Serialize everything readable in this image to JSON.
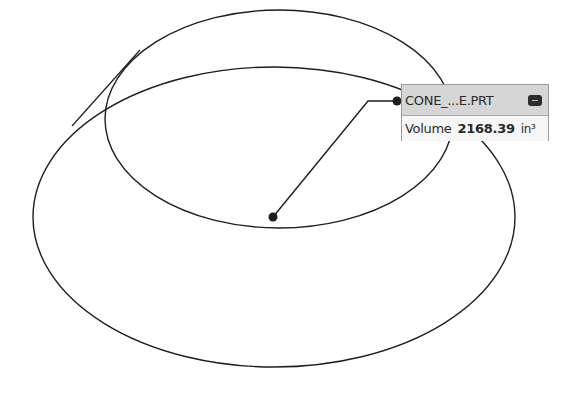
{
  "viewport": {
    "background": "#ffffff",
    "line_color": "#1e1e1e",
    "geometry": {
      "upper_ellipse": {
        "cx": 279,
        "cy": 119,
        "rx": 174,
        "ry": 109
      },
      "lower_ellipse": {
        "cx": 274,
        "cy": 217,
        "rx": 241,
        "ry": 150
      },
      "silhouette_line": {
        "x1": 140,
        "y1": 50,
        "x2": 72,
        "y2": 126
      },
      "center_point": {
        "x": 273,
        "y": 217
      },
      "anchor_point": {
        "x": 397,
        "y": 101
      }
    }
  },
  "callout": {
    "title": "CONE_...E.PRT",
    "minimize_icon": "minimize-icon",
    "measure_label": "Volume",
    "measure_value": "2168.39",
    "measure_unit": "in³"
  }
}
